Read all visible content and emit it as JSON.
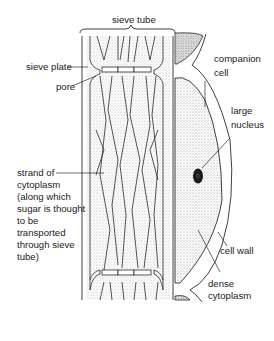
{
  "diagram": {
    "labels": {
      "sieve_tube": "sieve tube",
      "sieve_plate": "sieve plate",
      "pore": "pore",
      "companion_cell": "companion\ncell",
      "large_nucleus": "large\nnucleus",
      "strand_of_cytoplasm": "strand of\ncytoplasm\n(along which\nsugar is thought\nto be\ntransported\nthrough sieve\ntube)",
      "cell_wall": "cell wall",
      "dense_cytoplasm": "dense\ncytoplasm"
    },
    "colors": {
      "line": "#2a2a2a",
      "stipple": "#9a9a9a",
      "background": "#ffffff",
      "nucleus": "#1a1a1a"
    }
  }
}
